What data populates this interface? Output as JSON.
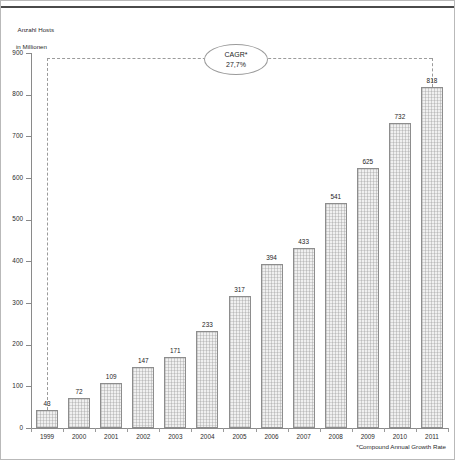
{
  "axis_caption": {
    "line1": "Anzahl Hosts",
    "line2": "in Millionen"
  },
  "annotation": {
    "label": "CAGR*",
    "value": "27,7%"
  },
  "footnote": "*Compound Annual Growth Rate",
  "chart_data": {
    "type": "bar",
    "title": "",
    "subtitle": "",
    "xlabel": "",
    "ylabel": "Anzahl Hosts in Millionen",
    "categories": [
      "1999",
      "2000",
      "2001",
      "2002",
      "2003",
      "2004",
      "2005",
      "2006",
      "2007",
      "2008",
      "2009",
      "2010",
      "2011"
    ],
    "values": [
      43,
      72,
      109,
      147,
      171,
      233,
      317,
      394,
      433,
      541,
      625,
      732,
      818
    ],
    "value_labels": [
      "43",
      "72",
      "109",
      "147",
      "171",
      "233",
      "317",
      "394",
      "433",
      "541",
      "625",
      "732",
      "818"
    ],
    "ylim": [
      0,
      900
    ],
    "ytick_values": [
      0,
      100,
      200,
      300,
      400,
      500,
      600,
      700,
      800,
      900
    ],
    "ytick_labels": [
      "0",
      "100",
      "200",
      "300",
      "400",
      "500",
      "600",
      "700",
      "800",
      "900"
    ],
    "grid": false,
    "legend": "none",
    "annotations": [
      {
        "name": "cagr",
        "label": "CAGR*",
        "value": "27,7%",
        "from_category": "1999",
        "to_category": "2011"
      }
    ],
    "colors": {
      "bar_fill": "#f0f0f0",
      "bar_border": "#8d8d8d",
      "axis": "#8a8a8a",
      "text": "#1d1d1d",
      "annotation_line": "#9b9b9b"
    }
  }
}
